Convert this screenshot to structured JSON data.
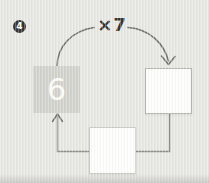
{
  "worksheet": {
    "problem_number": "4",
    "multiplier_label": "×7",
    "start_square_value": "6",
    "product_square_value": "",
    "bottom_square_value": ""
  },
  "colors": {
    "background": "#e7e7e3",
    "page_edge_shadow": "#d9d9d5",
    "filled_square": "#d1d2cb",
    "filled_square_digit": "#fbfbf7",
    "empty_square_fill": "#fdfdfb",
    "right_square_border": "#b4b5af",
    "bottom_square_border": "#c7c8c1",
    "arrow_stroke": "#74746f",
    "connector_stroke": "#8d8d88",
    "badge_fill": "#343434",
    "badge_text": "#ffffff",
    "label_text": "#343432"
  }
}
